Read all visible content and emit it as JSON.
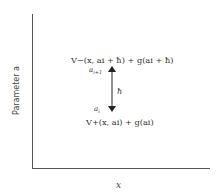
{
  "diagram": {
    "type": "parameter-step-diagram",
    "axes": {
      "x_label": "x",
      "y_label": "Parameter a"
    },
    "upper_level": {
      "label": "a_{i+1}",
      "label_display": "ai+1",
      "expression": "V−(x, ai + ħ) + g(ai + ħ)"
    },
    "lower_level": {
      "label": "a_i",
      "label_display": "ai",
      "expression": "V+(x, ai) + g(ai)"
    },
    "step": {
      "label": "ħ",
      "arrow": "double-headed vertical"
    },
    "colors": {
      "axis": "#555555",
      "text": "#333333",
      "arrow": "#222222",
      "background": "#ffffff"
    }
  }
}
